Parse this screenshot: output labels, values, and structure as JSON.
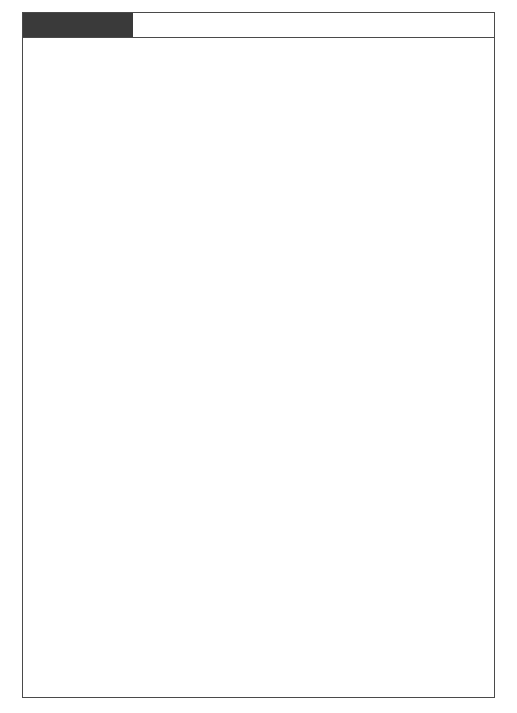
{
  "figure": {
    "tag": "FIGURE 7-23",
    "tag_bg": "#3a3a3a",
    "frame_color": "#4a4a4a"
  },
  "chart_data": {
    "type": "diagram",
    "subtype": "system-flowchart",
    "nodes": [
      {
        "id": "sales_orders",
        "label": "Sales\nOrders",
        "shape": "cylinder",
        "x": 159,
        "y": 84,
        "w": 82,
        "h": 54
      },
      {
        "id": "fg_inventory",
        "label": "FG\nInventory",
        "shape": "cylinder",
        "x": 281,
        "y": 84,
        "w": 82,
        "h": 54
      },
      {
        "id": "sales_forecast",
        "label": "Sales\nForecast",
        "shape": "cylinder",
        "x": 412,
        "y": 84,
        "w": 82,
        "h": 54
      },
      {
        "id": "production_planning",
        "label": "Production\nPlanning\nSystem",
        "shape": "process",
        "x": 281,
        "y": 167,
        "w": 58,
        "h": 46
      },
      {
        "id": "rm_inventory",
        "label": "RM\nInventory",
        "shape": "cylinder",
        "x": 122,
        "y": 248,
        "w": 80,
        "h": 52
      },
      {
        "id": "production_schedule_db",
        "label": "Production\nSchedule",
        "shape": "cylinder",
        "x": 281,
        "y": 248,
        "w": 82,
        "h": 52
      },
      {
        "id": "bom",
        "label": "BOM",
        "shape": "cylinder",
        "x": 412,
        "y": 248,
        "w": 82,
        "h": 52
      },
      {
        "id": "mrp_system",
        "label": "Materials\nRequirements\nPlanning\nSystem",
        "shape": "process",
        "x": 281,
        "y": 322,
        "w": 66,
        "h": 54
      },
      {
        "id": "production_schedule_doc",
        "label": "Production\nSchedule",
        "shape": "document",
        "x": 154,
        "y": 367,
        "w": 78,
        "h": 38
      },
      {
        "id": "performance_reports",
        "label": "Performance\nReports",
        "shape": "document",
        "x": 180,
        "y": 432,
        "w": 78,
        "h": 38
      },
      {
        "id": "exceptions",
        "label": "Exceptions",
        "shape": "document",
        "x": 200,
        "y": 497,
        "w": 78,
        "h": 34
      },
      {
        "id": "management",
        "label": "Management",
        "shape": "terminator",
        "x": 125,
        "y": 562,
        "w": 94,
        "h": 36
      },
      {
        "id": "rm_requirements",
        "label": "RM\nRequirements",
        "shape": "cylinder",
        "x": 408,
        "y": 425,
        "w": 80,
        "h": 52
      },
      {
        "id": "purchases_system",
        "label": "Purchases System",
        "shape": "terminator",
        "x": 408,
        "y": 505,
        "w": 104,
        "h": 34
      },
      {
        "id": "work_orders",
        "label": "Work\nOrders",
        "shape": "document",
        "x": 227,
        "y": 600,
        "w": 71,
        "h": 39
      },
      {
        "id": "materials_requisition",
        "label": "Materials\nRequisition",
        "shape": "document",
        "x": 352,
        "y": 600,
        "w": 71,
        "h": 39
      },
      {
        "id": "work_centers",
        "label": "Work Centers",
        "shape": "terminator",
        "x": 227,
        "y": 666,
        "w": 94,
        "h": 32
      },
      {
        "id": "rm_storekeeper",
        "label": "RM Storekeeper",
        "shape": "terminator",
        "x": 352,
        "y": 666,
        "w": 96,
        "h": 32
      }
    ],
    "edges": [
      {
        "from": "sales_orders",
        "to": "production_planning",
        "arrow": true
      },
      {
        "from": "fg_inventory",
        "to": "production_planning",
        "arrow": true
      },
      {
        "from": "sales_forecast",
        "to": "production_planning",
        "arrow": true
      },
      {
        "from": "production_planning",
        "to": "production_schedule_db",
        "arrow": true
      },
      {
        "from": "rm_inventory",
        "to": "mrp_system",
        "arrow": true
      },
      {
        "from": "production_schedule_db",
        "to": "mrp_system",
        "arrow": true
      },
      {
        "from": "bom",
        "to": "mrp_system",
        "arrow": true
      },
      {
        "from": "mrp_system",
        "to": "production_schedule_doc",
        "arrow": false
      },
      {
        "from": "mrp_system",
        "to": "performance_reports",
        "arrow": false
      },
      {
        "from": "mrp_system",
        "to": "exceptions",
        "arrow": false
      },
      {
        "from": "mrp_system",
        "to": "rm_requirements",
        "arrow": true
      },
      {
        "from": "mrp_system",
        "to": "work_orders",
        "arrow": false
      },
      {
        "from": "mrp_system",
        "to": "materials_requisition",
        "arrow": false
      },
      {
        "from": "production_schedule_doc",
        "to": "management",
        "arrow": true
      },
      {
        "from": "performance_reports",
        "to": "management",
        "arrow": true
      },
      {
        "from": "exceptions",
        "to": "management",
        "arrow": true
      },
      {
        "from": "rm_requirements",
        "to": "purchases_system",
        "arrow": true
      },
      {
        "from": "work_orders",
        "to": "work_centers",
        "arrow": true
      },
      {
        "from": "materials_requisition",
        "to": "rm_storekeeper",
        "arrow": true
      }
    ]
  }
}
